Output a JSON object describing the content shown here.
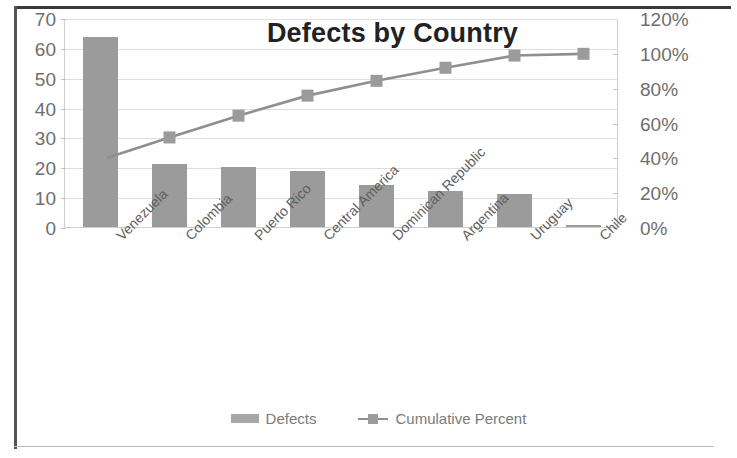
{
  "chart_data": {
    "type": "bar",
    "title": "Defects by Country",
    "xlabel": "",
    "ylabel": "",
    "grid": true,
    "legend_position": "bottom",
    "categories": [
      "Venezuela",
      "Colombia",
      "Puerto Rico",
      "Central America",
      "Dominican Republic",
      "Argentina",
      "Uruguay",
      "Chile"
    ],
    "series": [
      {
        "name": "Defects",
        "type": "bar",
        "axis": "left",
        "color": "#9b9b9b",
        "values": [
          64,
          21.5,
          20.3,
          19,
          14.3,
          12.5,
          11.5,
          1
        ]
      },
      {
        "name": "Cumulative Percent",
        "type": "line",
        "axis": "right",
        "color": "#8f8f8f",
        "values": [
          39,
          52,
          64.5,
          76,
          84.5,
          92,
          99,
          100
        ]
      }
    ],
    "ylim": [
      0,
      70
    ],
    "y2lim": [
      0,
      120
    ],
    "yticks": [
      "0",
      "10",
      "20",
      "30",
      "40",
      "50",
      "60",
      "70"
    ],
    "y2ticks": [
      "0%",
      "20%",
      "40%",
      "60%",
      "80%",
      "100%",
      "120%"
    ]
  },
  "legend": {
    "defects_label": "Defects",
    "cumulative_label": "Cumulative Percent"
  }
}
